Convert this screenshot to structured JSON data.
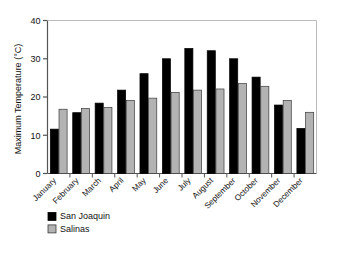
{
  "chart_data": {
    "type": "bar",
    "title": "",
    "xlabel": "",
    "ylabel": "Maximum Temperature (°C)",
    "ylim": [
      0,
      40
    ],
    "yticks": [
      0,
      10,
      20,
      30,
      40
    ],
    "ytick_labels": [
      "0",
      "10",
      "20",
      "30",
      "40"
    ],
    "grid": false,
    "legend_position": "bottom-left",
    "categories": [
      "January",
      "February",
      "March",
      "April",
      "May",
      "June",
      "July",
      "August",
      "September",
      "October",
      "November",
      "December"
    ],
    "series": [
      {
        "name": "San Joaquin",
        "color": "#000000",
        "values": [
          11.6,
          15.9,
          18.4,
          21.8,
          26.1,
          30.0,
          32.7,
          32.1,
          30.0,
          25.2,
          17.9,
          11.8
        ]
      },
      {
        "name": "Salinas",
        "color": "#b3b3b3",
        "values": [
          16.8,
          17.0,
          17.3,
          19.1,
          19.7,
          21.2,
          21.8,
          22.1,
          23.5,
          22.8,
          19.1,
          16.0
        ]
      }
    ]
  },
  "legend": {
    "items": [
      {
        "label": "San Joaquin",
        "swatch": "#000000"
      },
      {
        "label": "Salinas",
        "swatch": "#b3b3b3"
      }
    ]
  },
  "axis": {
    "y_title": "Maximum Temperature (°C)"
  }
}
